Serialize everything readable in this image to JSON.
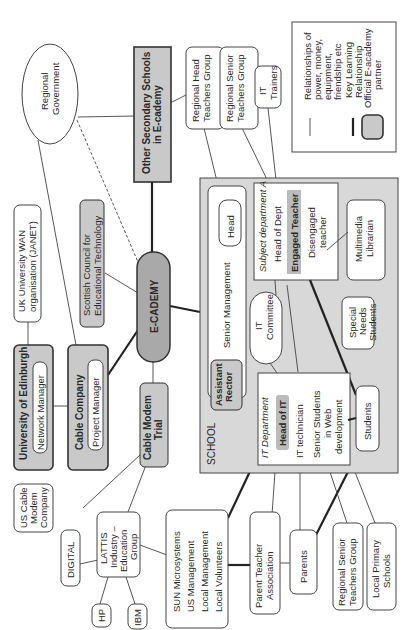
{
  "diagram": {
    "orientation": "rotated 90deg counter-clockwise",
    "center": {
      "label": "E-CADEMY"
    },
    "legend": {
      "thin_line": "Relationships of power, money, equipment, friendship etc",
      "thick_line": "Key Learning Relationship",
      "shaded_box": "Official E-academy partner"
    },
    "nodes": {
      "regional_government": "Regional Government",
      "other_secondary": "Other Secondary Schools in E-cademy",
      "regional_head_teachers": "Regional Head Teachers Group",
      "regional_senior_teachers_top": "Regional Senior Teachers Group",
      "it_trainers": "IT Trainers",
      "uk_wan": "UK University WAN organisation (JANET)",
      "scottish_council": "Scottish Council for Educational Technology",
      "uni_edinburgh": "University of Edinburgh",
      "network_manager": "Network Manager",
      "cable_company": "Cable Company",
      "project_manager": "Project Manager",
      "cable_modem_trial": "Cable Modem Trial",
      "us_cable_modem": "US Cable Modem Company",
      "lattis": "LATTIS Industry – Education Group",
      "digital": "DIGITAL",
      "hp": "HP",
      "ibm": "IBM",
      "sun_lines": [
        "SUN Microsystems",
        "US Management",
        "Local Management",
        "Local Volunteers"
      ],
      "pta": "Parent Teacher Association",
      "parents": "Parents",
      "regional_senior_teachers_bottom": "Regional Senior Teachers Group",
      "local_primary": "Local Primary Schools"
    },
    "school": {
      "label": "SCHOOL",
      "senior_management": "Senior Management",
      "head": "Head",
      "assistant_rector": "Assistant Rector",
      "it_committee": "IT Committee",
      "subject_dept": {
        "title": "Subject department A",
        "head": "Head of Dept",
        "engaged": "Engaged Teacher",
        "disengaged": "Disengaged teacher"
      },
      "it_dept": {
        "title": "IT Department",
        "head": "Head of IT",
        "technician": "IT technician",
        "senior_students": "Senior Students in Web development"
      },
      "multimedia_librarian": "Multimedia Librarian",
      "special_needs": "Special Needs Students",
      "students": "Students"
    }
  }
}
